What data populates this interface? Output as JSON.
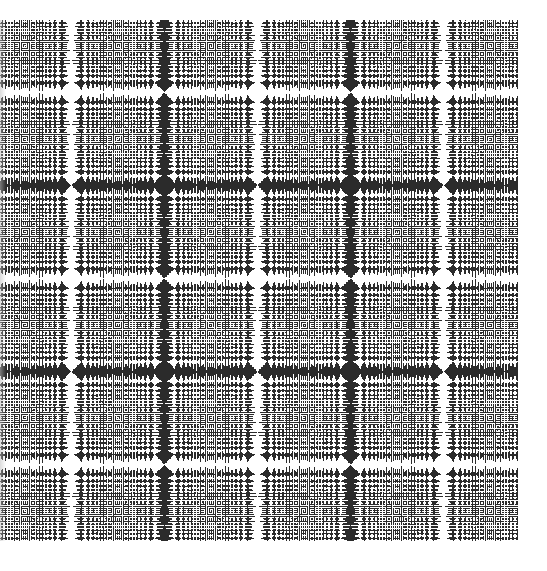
{
  "image": {
    "description": "Black-and-white moiré interference pattern (aliased zone-plate / chirp grid) with a central bullseye, four diagonal secondary bullseyes, X-shaped saddles on the axes, and grids of small ovals toward the edges",
    "canvas": {
      "width": 547,
      "height": 571,
      "background": "#ffffff"
    },
    "pattern": {
      "left": 0,
      "top": 20,
      "width": 518,
      "height": 521,
      "center_x": 257,
      "center_y": 278,
      "alias_period_px": 93,
      "ink_color": "#2b2b2b",
      "paper_color": "#ffffff",
      "invert": true
    },
    "features": {
      "main_bullseye": {
        "x": 257,
        "y": 278,
        "disk_radius": 16
      },
      "secondary_bullseyes": [
        {
          "x": 162,
          "y": 188
        },
        {
          "x": 350,
          "y": 188
        },
        {
          "x": 162,
          "y": 368
        },
        {
          "x": 350,
          "y": 368
        }
      ],
      "saddles": [
        {
          "x": 257,
          "y": 188
        },
        {
          "x": 257,
          "y": 368
        },
        {
          "x": 164,
          "y": 278
        },
        {
          "x": 350,
          "y": 278
        }
      ]
    }
  }
}
